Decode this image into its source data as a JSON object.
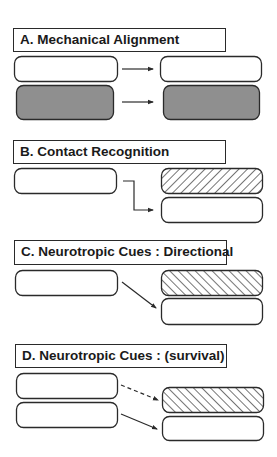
{
  "sections": [
    {
      "id": "A",
      "title": "A. Mechanical Alignment"
    },
    {
      "id": "B",
      "title": "B. Contact Recognition"
    },
    {
      "id": "C",
      "title": "C. Neurotropic Cues : Directional"
    },
    {
      "id": "D",
      "title": "D. Neurotropic Cues : (survival)"
    }
  ],
  "colors": {
    "stroke": "#2a2a2a",
    "gray_fill": "#8f8f8f",
    "white_fill": "#ffffff"
  }
}
